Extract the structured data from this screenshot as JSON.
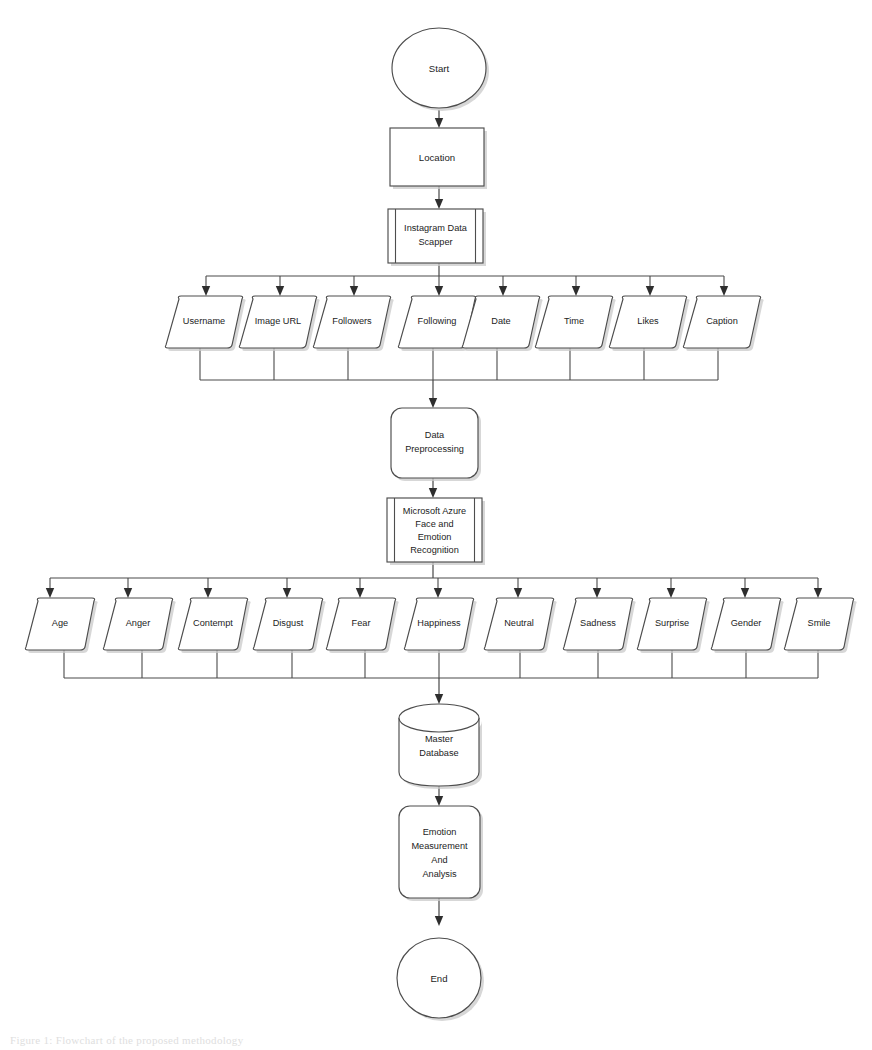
{
  "diagram": {
    "orientation": "top-to-bottom",
    "background_color": "#ffffff",
    "stroke_color": "#4d4d4d",
    "shadow_color": "#c9c9c9"
  },
  "nodes": {
    "start": {
      "label": "Start",
      "shape": "ellipse"
    },
    "location": {
      "label": "Location",
      "shape": "rectangle"
    },
    "scrapper": {
      "label_line1": "Instagram Data",
      "label_line2": "Scapper",
      "shape": "predefined-process"
    },
    "preprocessing": {
      "label_line1": "Data",
      "label_line2": "Preprocessing",
      "shape": "rounded-rectangle"
    },
    "azure": {
      "label_line1": "Microsoft Azure",
      "label_line2": "Face and",
      "label_line3": "Emotion",
      "label_line4": "Recognition",
      "shape": "predefined-process"
    },
    "database": {
      "label_line1": "Master",
      "label_line2": "Database",
      "shape": "cylinder"
    },
    "analysis": {
      "label_line1": "Emotion",
      "label_line2": "Measurement",
      "label_line3": "And",
      "label_line4": "Analysis",
      "shape": "rounded-rectangle"
    },
    "end": {
      "label": "End",
      "shape": "ellipse"
    }
  },
  "scraped_fields": {
    "shape": "parallelogram",
    "items": [
      {
        "label": "Username"
      },
      {
        "label": "Image URL"
      },
      {
        "label": "Followers"
      },
      {
        "label": "Following"
      },
      {
        "label": "Date"
      },
      {
        "label": "Time"
      },
      {
        "label": "Likes"
      },
      {
        "label": "Caption"
      }
    ]
  },
  "recognition_attributes": {
    "shape": "parallelogram",
    "items": [
      {
        "label": "Age"
      },
      {
        "label": "Anger"
      },
      {
        "label": "Contempt"
      },
      {
        "label": "Disgust"
      },
      {
        "label": "Fear"
      },
      {
        "label": "Happiness"
      },
      {
        "label": "Neutral"
      },
      {
        "label": "Sadness"
      },
      {
        "label": "Surprise"
      },
      {
        "label": "Gender"
      },
      {
        "label": "Smile"
      }
    ]
  },
  "caption": {
    "text": "Figure 1: Flowchart of the proposed methodology"
  }
}
